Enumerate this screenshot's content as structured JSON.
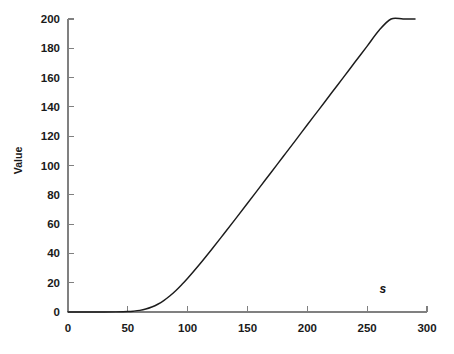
{
  "chart_data": {
    "type": "line",
    "title": "",
    "xlabel": "",
    "ylabel": "Value",
    "xlim": [
      0,
      300
    ],
    "ylim": [
      0,
      200
    ],
    "grid": false,
    "legend": null,
    "x_ticks": [
      0,
      50,
      100,
      150,
      200,
      250,
      300
    ],
    "x_tick_labels": [
      "0",
      "50",
      "100",
      "150",
      "200",
      "250",
      "300"
    ],
    "y_ticks": [
      0,
      20,
      40,
      60,
      80,
      100,
      120,
      140,
      160,
      180,
      200
    ],
    "y_tick_labels": [
      "0",
      "20",
      "40",
      "60",
      "80",
      "100",
      "120",
      "140",
      "160",
      "180",
      "200"
    ],
    "annotations": [
      {
        "text": "s",
        "x": 263,
        "y": 13,
        "style": "bold-italic"
      }
    ],
    "series": [
      {
        "name": "Value",
        "color": "#1c1c1c",
        "x": [
          0,
          10,
          20,
          30,
          40,
          50,
          55,
          60,
          65,
          70,
          75,
          80,
          85,
          90,
          95,
          100,
          110,
          120,
          130,
          140,
          150,
          160,
          170,
          180,
          190,
          200,
          210,
          220,
          230,
          240,
          250,
          260,
          270,
          280,
          290
        ],
        "y": [
          0.0,
          0.0,
          0.0,
          0.0,
          0.1,
          0.3,
          0.6,
          1.1,
          2.0,
          3.4,
          5.3,
          7.8,
          10.9,
          14.5,
          18.6,
          23.0,
          32.6,
          42.7,
          53.1,
          63.6,
          74.2,
          84.9,
          95.6,
          106.3,
          117.0,
          127.8,
          138.5,
          149.3,
          160.0,
          170.8,
          181.5,
          192.3,
          203.0,
          213.8,
          200.0
        ]
      }
    ]
  },
  "geometry": {
    "plot_left": 68,
    "plot_right": 427,
    "plot_top": 19,
    "plot_bottom": 312
  }
}
